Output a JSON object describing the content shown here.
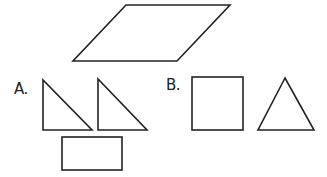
{
  "figure": {
    "target_shape": {
      "name": "parallelogram",
      "points": [
        [
          126,
          5
        ],
        [
          230,
          5
        ],
        [
          177,
          61
        ],
        [
          73,
          61
        ]
      ]
    },
    "options": [
      {
        "label": "A.",
        "pieces": [
          {
            "name": "right-triangle",
            "points": [
              [
                43,
                80
              ],
              [
                43,
                130
              ],
              [
                92,
                130
              ]
            ]
          },
          {
            "name": "right-triangle",
            "points": [
              [
                98,
                79
              ],
              [
                98,
                130
              ],
              [
                147,
                130
              ]
            ]
          },
          {
            "name": "rectangle",
            "x": 62,
            "y": 137,
            "width": 60,
            "height": 33
          }
        ]
      },
      {
        "label": "B.",
        "pieces": [
          {
            "name": "square",
            "x": 192,
            "y": 77,
            "width": 51,
            "height": 53
          },
          {
            "name": "equilateral-triangle",
            "points": [
              [
                285,
                78
              ],
              [
                258,
                130
              ],
              [
                314,
                130
              ]
            ]
          }
        ]
      }
    ],
    "stroke_color": "#222222",
    "background_color": "#ffffff"
  }
}
